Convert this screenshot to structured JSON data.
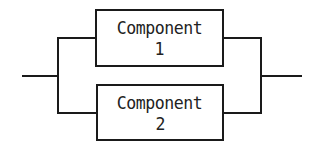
{
  "diagram": {
    "type": "parallel-system-block-diagram",
    "components": [
      {
        "label_line1": "Component",
        "label_line2": "1"
      },
      {
        "label_line1": "Component",
        "label_line2": "2"
      }
    ],
    "colors": {
      "line": "#1a1a1a",
      "text": "#222222",
      "background": "#ffffff"
    }
  }
}
